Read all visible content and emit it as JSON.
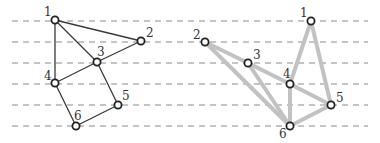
{
  "diagram": {
    "guide_lines": {
      "y": [
        21,
        42,
        63,
        84,
        105,
        126
      ],
      "x_start": 12,
      "x_end": 368,
      "color": "#8a8a8a"
    },
    "left_graph": {
      "edge_color": "#3a3a3a",
      "nodes": [
        {
          "id": "1",
          "label": "1",
          "x": 55,
          "y": 20,
          "lx": 44,
          "ly": 16
        },
        {
          "id": "2",
          "label": "2",
          "x": 141,
          "y": 41,
          "lx": 146,
          "ly": 37
        },
        {
          "id": "3",
          "label": "3",
          "x": 97,
          "y": 62,
          "lx": 97,
          "ly": 56
        },
        {
          "id": "4",
          "label": "4",
          "x": 55,
          "y": 83,
          "lx": 44,
          "ly": 80
        },
        {
          "id": "5",
          "label": "5",
          "x": 118,
          "y": 105,
          "lx": 122,
          "ly": 100
        },
        {
          "id": "6",
          "label": "6",
          "x": 76,
          "y": 126,
          "lx": 74,
          "ly": 120
        }
      ],
      "edges": [
        [
          "1",
          "2"
        ],
        [
          "1",
          "3"
        ],
        [
          "1",
          "4"
        ],
        [
          "2",
          "3"
        ],
        [
          "3",
          "4"
        ],
        [
          "3",
          "5"
        ],
        [
          "4",
          "6"
        ],
        [
          "5",
          "6"
        ]
      ]
    },
    "right_graph": {
      "edge_color": "#c2c2c2",
      "nodes": [
        {
          "id": "1",
          "label": "1",
          "x": 311,
          "y": 21,
          "lx": 300,
          "ly": 17
        },
        {
          "id": "2",
          "label": "2",
          "x": 205,
          "y": 42,
          "lx": 193,
          "ly": 39
        },
        {
          "id": "3",
          "label": "3",
          "x": 248,
          "y": 63,
          "lx": 253,
          "ly": 59
        },
        {
          "id": "4",
          "label": "4",
          "x": 290,
          "y": 84,
          "lx": 283,
          "ly": 78
        },
        {
          "id": "5",
          "label": "5",
          "x": 331,
          "y": 105,
          "lx": 336,
          "ly": 102
        },
        {
          "id": "6",
          "label": "6",
          "x": 290,
          "y": 126,
          "lx": 279,
          "ly": 138
        }
      ],
      "edges": [
        [
          "2",
          "3"
        ],
        [
          "2",
          "6"
        ],
        [
          "3",
          "4"
        ],
        [
          "3",
          "6"
        ],
        [
          "4",
          "1"
        ],
        [
          "4",
          "5"
        ],
        [
          "4",
          "6"
        ],
        [
          "1",
          "5"
        ],
        [
          "5",
          "6"
        ]
      ]
    }
  }
}
